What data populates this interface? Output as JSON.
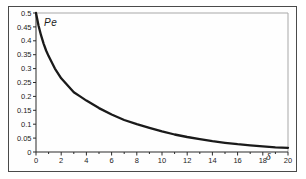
{
  "figure": {
    "background": "#fefefe",
    "frame_color": "#4a4a4a",
    "plot_border_color": "#a8a8a8",
    "axis_color": "#2a2a2a",
    "tick_color": "#2a2a2a",
    "label_color": "#1c1c1c"
  },
  "chart_data": {
    "type": "line",
    "title": "",
    "ylabel": "Pe",
    "xlabel": "δ",
    "xlim": [
      0,
      20
    ],
    "ylim": [
      0,
      0.5
    ],
    "x_major_ticks": [
      0,
      2,
      4,
      6,
      8,
      10,
      12,
      14,
      16,
      18,
      20
    ],
    "x_tick_labels": [
      "0",
      "2",
      "4",
      "6",
      "8",
      "10",
      "12",
      "14",
      "16",
      "18",
      "20"
    ],
    "x_minor_step": 1,
    "y_ticks": [
      0,
      0.05,
      0.1,
      0.15,
      0.2,
      0.25,
      0.3,
      0.35,
      0.4,
      0.45,
      0.5
    ],
    "y_tick_labels": [
      "0",
      "0.05",
      "0.1",
      "0.15",
      "0.2",
      "0.25",
      "0.3",
      "0.35",
      "0.4",
      "0.45",
      "0.5"
    ],
    "grid": false,
    "legend": null,
    "series": [
      {
        "name": "Pe",
        "color": "#1a1a1a",
        "stroke_width": 2.3,
        "points": [
          [
            0,
            0.5
          ],
          [
            0.2,
            0.455
          ],
          [
            0.4,
            0.42
          ],
          [
            0.6,
            0.39
          ],
          [
            0.8,
            0.365
          ],
          [
            1,
            0.345
          ],
          [
            1.5,
            0.3
          ],
          [
            2,
            0.265
          ],
          [
            2.5,
            0.24
          ],
          [
            3,
            0.215
          ],
          [
            3.5,
            0.2
          ],
          [
            4,
            0.185
          ],
          [
            5,
            0.158
          ],
          [
            6,
            0.135
          ],
          [
            7,
            0.115
          ],
          [
            8,
            0.1
          ],
          [
            9,
            0.087
          ],
          [
            10,
            0.074
          ],
          [
            11,
            0.063
          ],
          [
            12,
            0.054
          ],
          [
            13,
            0.046
          ],
          [
            14,
            0.039
          ],
          [
            15,
            0.033
          ],
          [
            16,
            0.028
          ],
          [
            17,
            0.024
          ],
          [
            18,
            0.02
          ],
          [
            19,
            0.017
          ],
          [
            20,
            0.015
          ]
        ]
      }
    ]
  }
}
